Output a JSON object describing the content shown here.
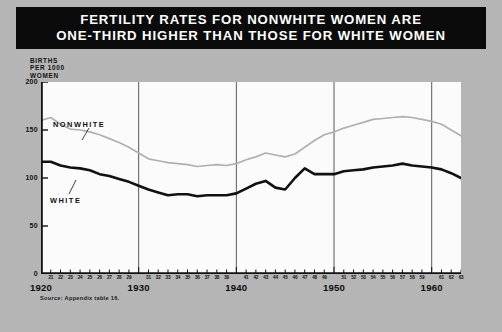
{
  "title": {
    "line1": "FERTILITY RATES FOR NONWHITE WOMEN ARE",
    "line2": "ONE-THIRD HIGHER THAN THOSE FOR WHITE WOMEN"
  },
  "axis_caption": {
    "line1": "BIRTHS",
    "line2": "PER 1000",
    "line3": "WOMEN"
  },
  "source": "Source: Appendix table 16.",
  "labels": {
    "nonwhite": "NONWHITE",
    "white": "WHITE"
  },
  "colors": {
    "banner": "#0b0b0b",
    "banner_text": "#ffffff",
    "page_background": "#b5b5b5",
    "plot_background": "#fbfbfb",
    "white_series": "#111111",
    "nonwhite_series": "#b0b0b0",
    "axis": "#111111",
    "gridline": "#5a5a5a"
  },
  "chart_data": {
    "type": "line",
    "title": "FERTILITY RATES FOR NONWHITE WOMEN ARE ONE-THIRD HIGHER THAN THOSE FOR WHITE WOMEN",
    "xlabel": "",
    "ylabel": "BIRTHS PER 1000 WOMEN",
    "ylim": [
      0,
      200
    ],
    "xlim": [
      1920,
      1963
    ],
    "yticks": [
      0,
      50,
      100,
      150,
      200
    ],
    "ytick_labels": [
      "0",
      "50",
      "100",
      "150",
      "200"
    ],
    "grid": false,
    "decade_gridlines": [
      1930,
      1940,
      1950,
      1960
    ],
    "legend": "inline-labels",
    "x": [
      1920,
      1921,
      1922,
      1923,
      1924,
      1925,
      1926,
      1927,
      1928,
      1929,
      1930,
      1931,
      1932,
      1933,
      1934,
      1935,
      1936,
      1937,
      1938,
      1939,
      1940,
      1941,
      1942,
      1943,
      1944,
      1945,
      1946,
      1947,
      1948,
      1949,
      1950,
      1951,
      1952,
      1953,
      1954,
      1955,
      1956,
      1957,
      1958,
      1959,
      1960,
      1961,
      1962,
      1963
    ],
    "xtick_labels": [
      "1920",
      "21",
      "22",
      "23",
      "24",
      "25",
      "26",
      "27",
      "28",
      "29",
      "1930",
      "31",
      "32",
      "33",
      "34",
      "35",
      "36",
      "37",
      "38",
      "39",
      "1940",
      "41",
      "42",
      "43",
      "44",
      "45",
      "46",
      "47",
      "48",
      "49",
      "1950",
      "51",
      "52",
      "53",
      "54",
      "55",
      "56",
      "57",
      "58",
      "59",
      "1960",
      "61",
      "62",
      "63"
    ],
    "decade_labels": [
      "1920",
      "1930",
      "1940",
      "1950",
      "1960"
    ],
    "series": [
      {
        "name": "NONWHITE",
        "color": "#b0b0b0",
        "values": [
          160,
          163,
          156,
          151,
          150,
          148,
          145,
          141,
          137,
          132,
          126,
          120,
          118,
          116,
          115,
          114,
          112,
          113,
          114,
          113,
          115,
          119,
          122,
          126,
          124,
          122,
          125,
          132,
          139,
          145,
          148,
          152,
          155,
          158,
          161,
          162,
          163,
          164,
          163,
          161,
          159,
          156,
          150,
          144
        ]
      },
      {
        "name": "WHITE",
        "color": "#111111",
        "values": [
          117,
          117,
          113,
          111,
          110,
          108,
          104,
          102,
          99,
          96,
          92,
          88,
          85,
          82,
          83,
          83,
          81,
          82,
          82,
          82,
          84,
          89,
          94,
          97,
          90,
          88,
          100,
          110,
          104,
          104,
          104,
          107,
          108,
          109,
          111,
          112,
          113,
          115,
          113,
          112,
          111,
          109,
          105,
          100
        ]
      }
    ]
  }
}
